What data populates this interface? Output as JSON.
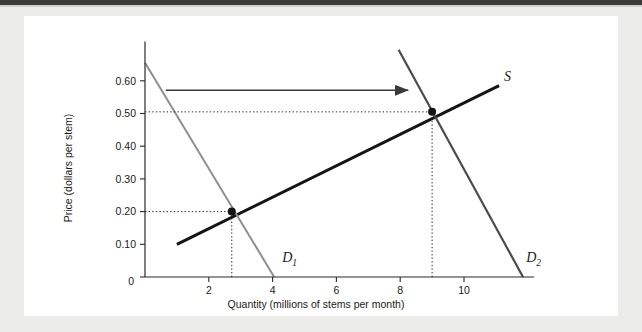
{
  "figure": {
    "background_color": "#ececeb",
    "panel_color": "#ffffff",
    "top_rule_color": "#3a3a3a"
  },
  "chart_data": {
    "type": "line",
    "title": "",
    "xlabel": "Quantity (millions of stems per month)",
    "ylabel": "Price (dollars per stem)",
    "xlim": [
      0,
      12.2
    ],
    "ylim": [
      0,
      0.72
    ],
    "xticks": [
      2,
      4,
      6,
      8,
      10
    ],
    "xtick_labels": [
      "2",
      "4",
      "6",
      "8",
      "10"
    ],
    "yticks": [
      0.1,
      0.2,
      0.3,
      0.4,
      0.5,
      0.6
    ],
    "ytick_labels": [
      "0.10",
      "0.20",
      "0.30",
      "0.40",
      "0.50",
      "0.60"
    ],
    "origin_label": "0",
    "grid": false,
    "legend": "none",
    "series": [
      {
        "name": "S",
        "label": "S",
        "role": "supply",
        "color": "#141414",
        "width": 3.0,
        "points": [
          [
            1.0,
            0.1
          ],
          [
            11.1,
            0.585
          ]
        ]
      },
      {
        "name": "D1",
        "label": "D",
        "label_sub": "1",
        "role": "demand-original",
        "color": "#8e8e8e",
        "width": 2.0,
        "points": [
          [
            0.0,
            0.655
          ],
          [
            4.05,
            0.0
          ]
        ]
      },
      {
        "name": "D2",
        "label": "D",
        "label_sub": "2",
        "role": "demand-shifted",
        "color": "#4a4a4a",
        "width": 2.2,
        "points": [
          [
            7.95,
            0.695
          ],
          [
            11.85,
            0.0
          ]
        ]
      }
    ],
    "equilibria": [
      {
        "name": "equilibrium-1",
        "x": 2.72,
        "y": 0.2,
        "marker": "dot",
        "color": "#141414"
      },
      {
        "name": "equilibrium-2",
        "x": 9.0,
        "y": 0.505,
        "marker": "dot",
        "color": "#141414"
      }
    ],
    "guide_lines": [
      {
        "name": "guide-price-020",
        "orientation": "horizontal",
        "value": 0.2,
        "from_x": 0,
        "to_x": 2.72
      },
      {
        "name": "guide-quantity-2p7",
        "orientation": "vertical",
        "value": 2.72,
        "from_y": 0,
        "to_y": 0.2
      },
      {
        "name": "guide-price-050",
        "orientation": "horizontal",
        "value": 0.505,
        "from_x": 0,
        "to_x": 9.0
      },
      {
        "name": "guide-quantity-9",
        "orientation": "vertical",
        "value": 9.0,
        "from_y": 0,
        "to_y": 0.505
      }
    ],
    "annotations": [
      {
        "name": "demand-shift-arrow",
        "type": "arrow",
        "direction": "right",
        "y": 0.571,
        "from_x": 0.65,
        "to_x": 8.25,
        "color": "#3a3a3a"
      }
    ]
  }
}
